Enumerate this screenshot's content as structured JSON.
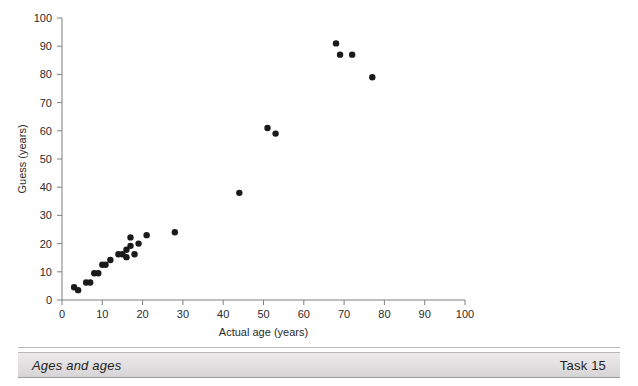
{
  "figure": {
    "background_color": "#ffffff",
    "axis_color": "#7f7f7f",
    "point_color": "#1a1a1a"
  },
  "caption": {
    "title": "Ages and ages",
    "task_label": "Task 15"
  },
  "chart_data": {
    "type": "scatter",
    "title": "",
    "xlabel": "Actual age (years)",
    "ylabel": "Guess (years)",
    "xlim": [
      0,
      100
    ],
    "ylim": [
      0,
      100
    ],
    "xticks": [
      0,
      10,
      20,
      30,
      40,
      50,
      60,
      70,
      80,
      90,
      100
    ],
    "yticks": [
      0,
      10,
      20,
      30,
      40,
      50,
      60,
      70,
      80,
      90,
      100
    ],
    "xtick_labels": [
      "0",
      "10",
      "20",
      "30",
      "40",
      "50",
      "60",
      "70",
      "80",
      "90",
      "100"
    ],
    "ytick_labels": [
      "0",
      "10",
      "20",
      "30",
      "40",
      "50",
      "60",
      "70",
      "80",
      "90",
      "100"
    ],
    "grid": false,
    "legend": null,
    "marker": "circle",
    "marker_size": 3.2,
    "points": [
      [
        3,
        4.5
      ],
      [
        4,
        3.5
      ],
      [
        6,
        6.2
      ],
      [
        7,
        6.2
      ],
      [
        8,
        9.5
      ],
      [
        9,
        9.5
      ],
      [
        10,
        12.5
      ],
      [
        10.8,
        12.5
      ],
      [
        12,
        14.2
      ],
      [
        14,
        16.2
      ],
      [
        15,
        16.2
      ],
      [
        16,
        17.8
      ],
      [
        16,
        15.2
      ],
      [
        17,
        22.2
      ],
      [
        17,
        19.2
      ],
      [
        18,
        16.2
      ],
      [
        19,
        20.0
      ],
      [
        21,
        23.0
      ],
      [
        28,
        24.0
      ],
      [
        44,
        38.0
      ],
      [
        51,
        61.0
      ],
      [
        53,
        59.0
      ],
      [
        68,
        91.0
      ],
      [
        69,
        87.0
      ],
      [
        72,
        87.0
      ],
      [
        77,
        79.0
      ]
    ]
  }
}
